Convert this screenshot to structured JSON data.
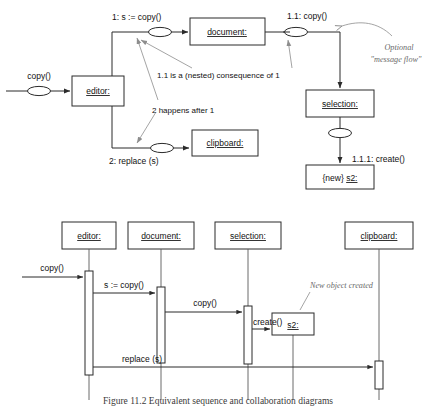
{
  "figure": {
    "caption": "Figure 11.2  Equivalent sequence and collaboration diagrams",
    "kinds": [
      "collaboration-diagram",
      "sequence-diagram"
    ]
  },
  "collaboration": {
    "objects": [
      {
        "id": "editor",
        "label": "editor:"
      },
      {
        "id": "document",
        "label": "document:"
      },
      {
        "id": "selection",
        "label": "selection:"
      },
      {
        "id": "clipboard",
        "label": "clipboard:"
      },
      {
        "id": "s2",
        "label_prefix": "{new} ",
        "label": "s2:"
      }
    ],
    "messages": [
      {
        "id": "m0",
        "label": "copy()"
      },
      {
        "id": "m1",
        "label": "1: s := copy()"
      },
      {
        "id": "m11",
        "label": "1.1: copy()"
      },
      {
        "id": "m111",
        "label": "1.1.1: create()"
      },
      {
        "id": "m2",
        "label": "2: replace (s)"
      }
    ],
    "annotations": [
      {
        "id": "nested",
        "text": "1.1 is a (nested) consequence of 1"
      },
      {
        "id": "ordering",
        "text": "2 happens after 1"
      },
      {
        "id": "messageflow1",
        "text": "Optional"
      },
      {
        "id": "messageflow2",
        "text": "\"message flow\""
      }
    ]
  },
  "sequence": {
    "lifelines": [
      {
        "id": "editor",
        "label": "editor:"
      },
      {
        "id": "document",
        "label": "document:"
      },
      {
        "id": "selection",
        "label": "selection:"
      },
      {
        "id": "clipboard",
        "label": "clipboard:"
      }
    ],
    "created_object": {
      "id": "s2",
      "label": "s2:"
    },
    "messages": [
      {
        "id": "sm0",
        "label": "copy()"
      },
      {
        "id": "sm1",
        "label": "s := copy()"
      },
      {
        "id": "sm2",
        "label": "copy()"
      },
      {
        "id": "sm3",
        "label": "create()"
      },
      {
        "id": "sm4",
        "label": "replace (s)"
      }
    ],
    "annotations": [
      {
        "id": "newobj",
        "text": "New object created"
      }
    ]
  },
  "colors": {
    "ink": "#2b2b2b",
    "note_ink": "#6a6a6a",
    "lifeline": "#5a5a5a",
    "paper": "#ffffff"
  }
}
